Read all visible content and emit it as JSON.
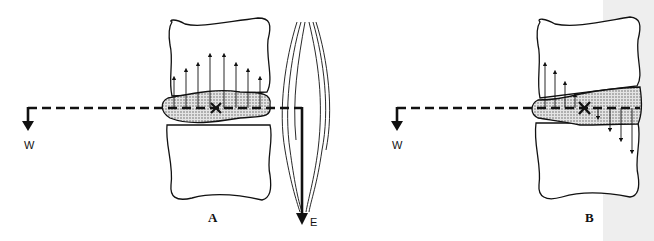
{
  "figure": {
    "panels": [
      {
        "id": "A",
        "label": "A",
        "weight_label": "W",
        "muscle_force_label": "E",
        "description": "Disc loaded with weight W balanced by extensor muscle force E; uniform compressive stress across disc"
      },
      {
        "id": "B",
        "label": "B",
        "weight_label": "W",
        "description": "Disc loaded with weight W without muscle force; anterior compression, posterior tension"
      }
    ],
    "colors": {
      "ink": "#111111",
      "disc_fill": "#bdbdbd",
      "scan_shade": "#eeeeee",
      "background": "#ffffff"
    }
  }
}
